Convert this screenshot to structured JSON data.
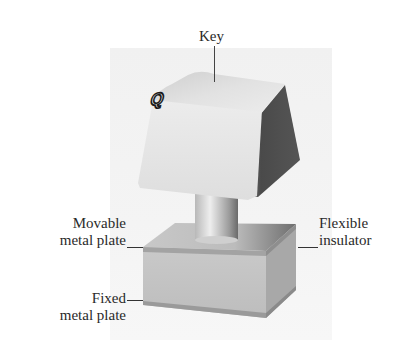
{
  "diagram": {
    "key_glyph": "Q",
    "labels": {
      "key": "Key",
      "movable_line1": "Movable",
      "movable_line2": "metal plate",
      "fixed_line1": "Fixed",
      "fixed_line2": "metal plate",
      "flexible_line1": "Flexible",
      "flexible_line2": "insulator"
    },
    "colors": {
      "background": "#ffffff",
      "panel": "#f3f3f3",
      "keycap_top": "#d9d9d9",
      "keycap_front": "#e6e6e6",
      "keycap_side": "#4a4a4a",
      "stem": "#d0d0d0",
      "base_top": "#bdbdbd",
      "base_front": "#c4c4c4",
      "base_side": "#a9a9a9",
      "label_text": "#2a2a2a"
    }
  }
}
